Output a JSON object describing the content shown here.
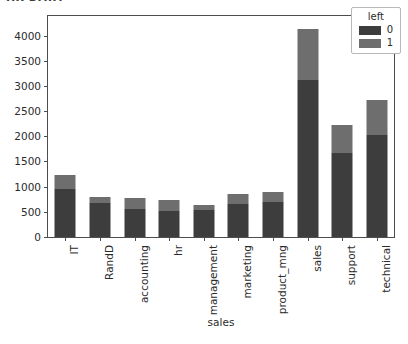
{
  "figure": {
    "clipped_top_text": "HR DATA",
    "background": "#ffffff"
  },
  "legend": {
    "title": "left",
    "entries": [
      {
        "label": "0",
        "color": "#3d3d3d"
      },
      {
        "label": "1",
        "color": "#6e6e6e"
      }
    ]
  },
  "chart_data": {
    "type": "bar",
    "subtype": "stacked-bar",
    "title": "",
    "xlabel": "sales",
    "ylabel": "",
    "categories": [
      "IT",
      "RandD",
      "accounting",
      "hr",
      "management",
      "marketing",
      "product_mng",
      "sales",
      "support",
      "technical"
    ],
    "series": [
      {
        "name": "0",
        "color": "#3d3d3d",
        "values": [
          954,
          666,
          563,
          524,
          539,
          655,
          704,
          3126,
          1674,
          2023
        ]
      },
      {
        "name": "1",
        "color": "#6e6e6e",
        "values": [
          273,
          121,
          204,
          215,
          91,
          203,
          198,
          1014,
          555,
          697
        ]
      }
    ],
    "totals": [
      1227,
      787,
      767,
      739,
      630,
      858,
      902,
      4140,
      2229,
      2720
    ],
    "ylim": [
      0,
      4390
    ],
    "yticks": [
      0,
      500,
      1000,
      1500,
      2000,
      2500,
      3000,
      3500,
      4000
    ],
    "ytick_labels": [
      "0",
      "500",
      "1000",
      "1500",
      "2000",
      "2500",
      "3000",
      "3500",
      "4000"
    ],
    "grid": false,
    "legend_position": "upper right",
    "xtick_rotation": -90
  }
}
